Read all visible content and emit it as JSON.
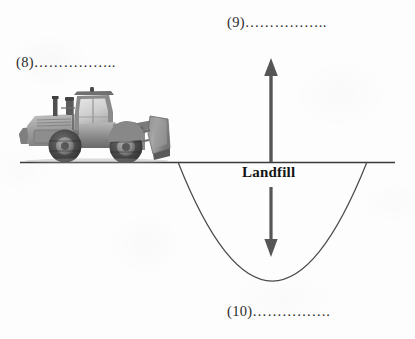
{
  "diagram": {
    "title_text": "Landfill",
    "background_color": "#fefefe",
    "line_color": "#3a3a3a",
    "curve_color": "#4a4a4a",
    "arrow_color": "#555555",
    "ground_line": {
      "x_start": 20,
      "x_end": 395,
      "y": 162
    },
    "pit_curve": {
      "shape": "parabola",
      "left_rim_x": 178,
      "right_rim_x": 367,
      "rim_y": 162,
      "bottom_x": 272,
      "bottom_y": 281
    },
    "arrows": [
      {
        "name": "up-arrow",
        "direction": "up",
        "x": 271,
        "y_tail": 162,
        "y_head": 60
      },
      {
        "name": "down-arrow",
        "direction": "down",
        "x": 271,
        "y_tail": 187,
        "y_head": 256
      }
    ],
    "labels": [
      {
        "id": "8",
        "text": "(8)……………..",
        "number": "(8)",
        "dots": "……………..",
        "points_to": "bulldozer"
      },
      {
        "id": "9",
        "text": "(9)……………..",
        "number": "(9)",
        "dots": "……………..",
        "points_to": "up-arrow"
      },
      {
        "id": "10",
        "text": "(10)…………….",
        "number": "(10)",
        "dots": "…………….",
        "points_to": "pit-bottom"
      }
    ],
    "equipment": {
      "name": "bulldozer",
      "description": "wheel dozer / front-end loader, grayscale photo",
      "x": 17,
      "y": 86,
      "width": 157,
      "height": 77
    }
  }
}
